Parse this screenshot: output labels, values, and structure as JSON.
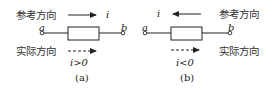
{
  "diagrams": [
    {
      "id": "a",
      "reference_label": "参考方向",
      "actual_label": "实际方向",
      "current_symbol": "i",
      "terminal_left": "a",
      "terminal_right": "b",
      "reference_arrow_direction": "right",
      "actual_arrow_direction": "right",
      "condition": "i>0",
      "caption": "(a)"
    },
    {
      "id": "b",
      "reference_label": "参考方向",
      "actual_label": "实际方向",
      "current_symbol": "i",
      "terminal_left": "a",
      "terminal_right": "b",
      "reference_arrow_direction": "left",
      "actual_arrow_direction": "right",
      "condition": "i<0",
      "caption": "(b)"
    }
  ],
  "colors": {
    "line": "#222222",
    "text": "#333333",
    "background": "#ffffff"
  }
}
